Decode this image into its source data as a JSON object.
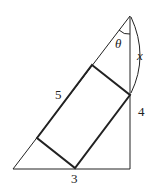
{
  "diagram": {
    "type": "right triangle with inscribed rectangle",
    "labels": {
      "hypotenuse": "5",
      "vertical_side": "4",
      "base": "3",
      "angle": "θ",
      "segment": "x"
    },
    "colors": {
      "stroke": "#222222",
      "background": "#ffffff"
    }
  }
}
